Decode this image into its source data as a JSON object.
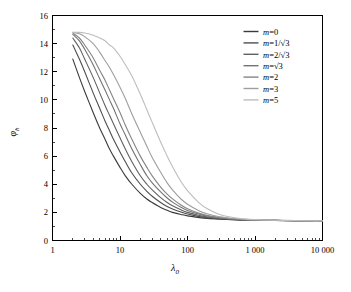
{
  "chart_data": {
    "type": "line",
    "title": "",
    "xlabel": "λ₀",
    "ylabel": "φₕ",
    "xscale": "log",
    "yscale": "linear",
    "xlim": [
      1,
      10000
    ],
    "ylim": [
      0,
      16
    ],
    "grid": false,
    "legend_position": "top-right",
    "xticklabels": [
      "1",
      "10",
      "100",
      "1 000",
      "10 000"
    ],
    "xtickvalues": [
      1,
      10,
      100,
      1000,
      10000
    ],
    "yticklabels": [
      "0",
      "2",
      "4",
      "6",
      "8",
      "10",
      "12",
      "14",
      "16"
    ],
    "ytickvalues": [
      0,
      2,
      4,
      6,
      8,
      10,
      12,
      14,
      16
    ],
    "asymptote": 1.4,
    "x": [
      2,
      2.5,
      3,
      4,
      5,
      6,
      7,
      8,
      10,
      12,
      15,
      20,
      25,
      30,
      40,
      50,
      60,
      80,
      100,
      150,
      200,
      300,
      500,
      700,
      1000,
      2000,
      4000,
      7000,
      10000
    ],
    "series": [
      {
        "name": "m=0",
        "label": "m=0",
        "color": "#3a3a3a",
        "values": [
          12.9,
          11.6,
          10.6,
          9.1,
          8.0,
          7.2,
          6.5,
          6.0,
          5.2,
          4.6,
          4.0,
          3.35,
          2.95,
          2.7,
          2.35,
          2.15,
          2.0,
          1.85,
          1.75,
          1.63,
          1.57,
          1.52,
          1.47,
          1.45,
          1.44,
          1.42,
          1.41,
          1.4,
          1.4
        ]
      },
      {
        "name": "m=1/√3",
        "label": "m=1/√3",
        "color": "#4e4e4e",
        "values": [
          13.9,
          12.9,
          12.0,
          10.5,
          9.4,
          8.5,
          7.8,
          7.2,
          6.3,
          5.6,
          4.8,
          4.0,
          3.5,
          3.15,
          2.7,
          2.42,
          2.24,
          2.02,
          1.88,
          1.7,
          1.62,
          1.55,
          1.49,
          1.46,
          1.45,
          1.43,
          1.41,
          1.4,
          1.4
        ]
      },
      {
        "name": "m=2/√3",
        "label": "m=2/√3",
        "color": "#606060",
        "values": [
          14.4,
          13.7,
          12.9,
          11.6,
          10.5,
          9.6,
          8.9,
          8.3,
          7.3,
          6.5,
          5.6,
          4.6,
          4.0,
          3.6,
          3.05,
          2.7,
          2.47,
          2.18,
          2.0,
          1.78,
          1.67,
          1.58,
          1.51,
          1.47,
          1.45,
          1.43,
          1.41,
          1.4,
          1.4
        ]
      },
      {
        "name": "m=√3",
        "label": "m=√3",
        "color": "#737373",
        "values": [
          14.65,
          14.2,
          13.6,
          12.5,
          11.5,
          10.7,
          10.0,
          9.4,
          8.3,
          7.5,
          6.5,
          5.4,
          4.6,
          4.1,
          3.45,
          3.02,
          2.73,
          2.36,
          2.14,
          1.86,
          1.72,
          1.61,
          1.52,
          1.48,
          1.46,
          1.43,
          1.41,
          1.4,
          1.4
        ]
      },
      {
        "name": "m=2",
        "label": "m=2",
        "color": "#858585",
        "values": [
          14.75,
          14.4,
          13.9,
          13.0,
          12.1,
          11.4,
          10.7,
          10.1,
          9.1,
          8.2,
          7.2,
          6.0,
          5.2,
          4.6,
          3.8,
          3.3,
          2.96,
          2.52,
          2.26,
          1.93,
          1.77,
          1.63,
          1.53,
          1.49,
          1.46,
          1.43,
          1.41,
          1.4,
          1.4
        ]
      },
      {
        "name": "m=3",
        "label": "m=3",
        "color": "#9e9e9e",
        "values": [
          14.8,
          14.7,
          14.5,
          14.0,
          13.4,
          12.8,
          12.3,
          11.8,
          10.9,
          10.1,
          9.0,
          7.7,
          6.7,
          5.9,
          4.85,
          4.1,
          3.6,
          2.95,
          2.58,
          2.1,
          1.88,
          1.69,
          1.56,
          1.5,
          1.47,
          1.44,
          1.41,
          1.4,
          1.4
        ]
      },
      {
        "name": "m=5",
        "label": "m=5",
        "color": "#bdbdbd",
        "values": [
          14.8,
          14.8,
          14.75,
          14.6,
          14.4,
          14.2,
          13.9,
          13.7,
          13.1,
          12.5,
          11.7,
          10.4,
          9.3,
          8.4,
          7.0,
          6.0,
          5.25,
          4.2,
          3.55,
          2.66,
          2.24,
          1.85,
          1.62,
          1.54,
          1.49,
          1.44,
          1.42,
          1.4,
          1.4
        ]
      }
    ]
  }
}
